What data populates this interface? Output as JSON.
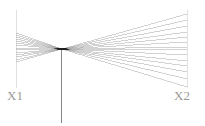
{
  "figure": {
    "type": "ray-diagram",
    "title": "",
    "background_color": "#ffffff",
    "width": 205,
    "height": 126
  },
  "labels": {
    "left_axis_label": "X1",
    "right_axis_label": "X2"
  },
  "colors": {
    "ray_line": "#9e9e9e",
    "axis_line": "#d8d8d8",
    "center_line": "#6b6b6b",
    "focus_core": "#1a1a1a",
    "label_text": "#9a9a9a"
  },
  "chart_data": {
    "type": "line",
    "title": "",
    "xlabel": "",
    "ylabel": "",
    "grid": false,
    "legend": "none",
    "xlim": [
      0,
      205
    ],
    "ylim": [
      0,
      126
    ],
    "annotations": [
      {
        "text": "X1",
        "x": 16,
        "y": 95
      },
      {
        "text": "X2",
        "x": 187,
        "y": 95
      }
    ],
    "axes": [
      {
        "name": "X1",
        "x": 16,
        "y_start": 10,
        "y_end": 88,
        "color": "#d8d8d8"
      },
      {
        "name": "X2",
        "x": 187,
        "y_start": 10,
        "y_end": 88,
        "color": "#d8d8d8"
      }
    ],
    "focus_point": {
      "x": 62,
      "y": 49
    },
    "center_line": {
      "x": 61,
      "y_start": 49,
      "y_end": 123,
      "color": "#6b6b6b"
    },
    "left_fan": {
      "x_start": 16,
      "x_end": 62,
      "count": 14,
      "y_start_values": [
        33,
        35,
        37,
        39,
        41,
        43,
        45,
        48,
        50,
        53,
        55,
        57,
        60,
        62
      ],
      "y_end": 49
    },
    "right_fan": {
      "x_start": 62,
      "x_end": 187,
      "count": 14,
      "y_start": 49,
      "y_end_values": [
        14,
        20,
        26,
        32,
        37,
        42,
        47,
        50,
        55,
        61,
        66,
        72,
        79,
        87
      ]
    }
  }
}
